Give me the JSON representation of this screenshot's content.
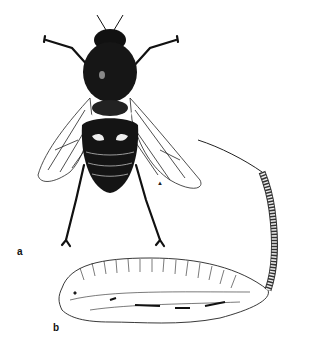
{
  "figure": {
    "panels": [
      {
        "label": "a",
        "subject": "adult fly, dorsal view"
      },
      {
        "label": "b",
        "subject": "larva with long tail"
      }
    ],
    "marker": "▲",
    "colors": {
      "ink": "#111111",
      "background": "#ffffff"
    }
  }
}
